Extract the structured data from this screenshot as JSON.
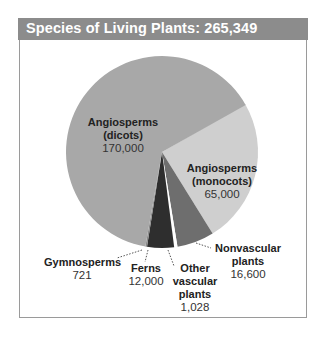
{
  "chart_data": {
    "type": "pie",
    "title": "Species of Living Plants: 265,349",
    "total": 265349,
    "slices": [
      {
        "label": "Angiosperms (dicots)",
        "value": 170000,
        "value_label": "170,000",
        "color": "#a8a8a8"
      },
      {
        "label": "Angiosperms (monocots)",
        "value": 65000,
        "value_label": "65,000",
        "color": "#cfcfcf"
      },
      {
        "label": "Nonvascular plants",
        "value": 16600,
        "value_label": "16,600",
        "color": "#6e6e6e"
      },
      {
        "label": "Other vascular plants",
        "value": 1028,
        "value_label": "1,028",
        "color": "#ffffff"
      },
      {
        "label": "Ferns",
        "value": 12000,
        "value_label": "12,000",
        "color": "#2e2e2e"
      },
      {
        "label": "Gymnosperms",
        "value": 721,
        "value_label": "721",
        "color": "#8a8a8a"
      }
    ],
    "legend": "none (direct labels with dotted leader lines)"
  },
  "header": {
    "title": "Species of Living Plants: 265,349"
  },
  "labels": {
    "dicots": {
      "name1": "Angiosperms",
      "name2": "(dicots)",
      "value": "170,000"
    },
    "monocots": {
      "name1": "Angiosperms",
      "name2": "(monocots)",
      "value": "65,000"
    },
    "nonvascular": {
      "name1": "Nonvascular",
      "name2": "plants",
      "value": "16,600"
    },
    "other": {
      "name1": "Other",
      "name2": "vascular",
      "name3": "plants",
      "value": "1,028"
    },
    "ferns": {
      "name1": "Ferns",
      "value": "12,000"
    },
    "gymnosperms": {
      "name1": "Gymnosperms",
      "value": "721"
    }
  }
}
